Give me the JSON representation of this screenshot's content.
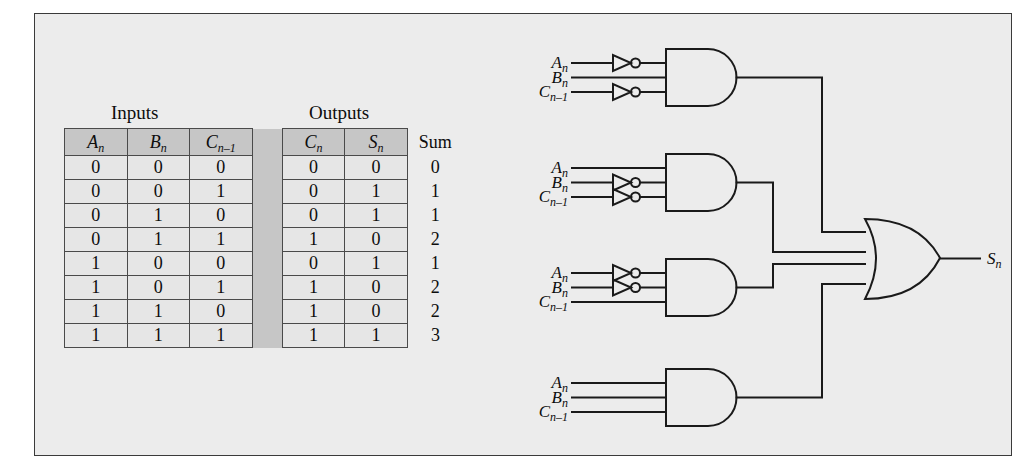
{
  "figure": {
    "background_color": "#ececec",
    "border_color": "#3a3a3a",
    "line_color": "#1a1a1a"
  },
  "truth_table": {
    "group_headers": {
      "inputs": "Inputs",
      "outputs": "Outputs"
    },
    "columns": [
      {
        "key": "An",
        "base": "A",
        "sub": "n",
        "group": "inputs"
      },
      {
        "key": "Bn",
        "base": "B",
        "sub": "n",
        "group": "inputs"
      },
      {
        "key": "Cn1",
        "base": "C",
        "sub": "n–1",
        "group": "inputs"
      },
      {
        "key": "Cn",
        "base": "C",
        "sub": "n",
        "group": "outputs"
      },
      {
        "key": "Sn",
        "base": "S",
        "sub": "n",
        "group": "outputs"
      }
    ],
    "sum_header": "Sum",
    "rows": [
      {
        "An": "0",
        "Bn": "0",
        "Cn1": "0",
        "Cn": "0",
        "Sn": "0",
        "Sum": "0"
      },
      {
        "An": "0",
        "Bn": "0",
        "Cn1": "1",
        "Cn": "0",
        "Sn": "1",
        "Sum": "1"
      },
      {
        "An": "0",
        "Bn": "1",
        "Cn1": "0",
        "Cn": "0",
        "Sn": "1",
        "Sum": "1"
      },
      {
        "An": "0",
        "Bn": "1",
        "Cn1": "1",
        "Cn": "1",
        "Sn": "0",
        "Sum": "2"
      },
      {
        "An": "1",
        "Bn": "0",
        "Cn1": "0",
        "Cn": "0",
        "Sn": "1",
        "Sum": "1"
      },
      {
        "An": "1",
        "Bn": "0",
        "Cn1": "1",
        "Cn": "1",
        "Sn": "0",
        "Sum": "2"
      },
      {
        "An": "1",
        "Bn": "1",
        "Cn1": "0",
        "Cn": "1",
        "Sn": "0",
        "Sum": "2"
      },
      {
        "An": "1",
        "Bn": "1",
        "Cn1": "1",
        "Cn": "1",
        "Sn": "1",
        "Sum": "3"
      }
    ]
  },
  "circuit": {
    "output_signal": {
      "base": "S",
      "sub": "n"
    },
    "input_names": [
      {
        "base": "A",
        "sub": "n"
      },
      {
        "base": "B",
        "sub": "n"
      },
      {
        "base": "C",
        "sub": "n–1"
      }
    ],
    "and_gates": [
      {
        "id": "and-gate-1",
        "inverted": [
          true,
          false,
          true
        ]
      },
      {
        "id": "and-gate-2",
        "inverted": [
          false,
          true,
          true
        ]
      },
      {
        "id": "and-gate-3",
        "inverted": [
          true,
          true,
          false
        ]
      },
      {
        "id": "and-gate-4",
        "inverted": [
          false,
          false,
          false
        ]
      }
    ],
    "or_gate": {
      "id": "or-gate-1",
      "inputs": 4
    }
  }
}
